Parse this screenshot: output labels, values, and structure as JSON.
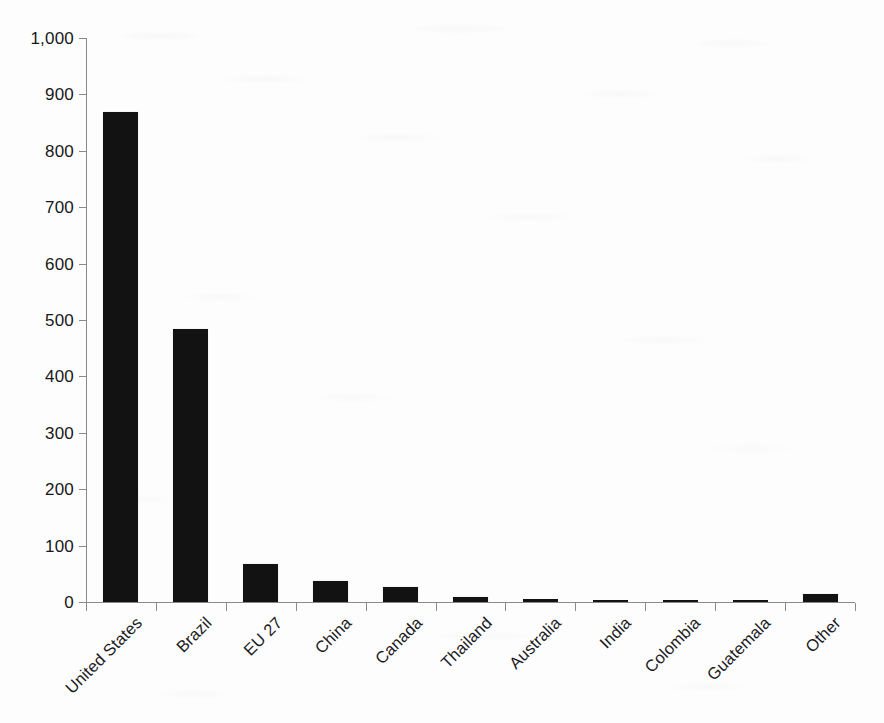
{
  "chart_data": {
    "type": "bar",
    "title": "",
    "subtitle": "",
    "xlabel": "",
    "ylabel": "",
    "categories": [
      "United States",
      "Brazil",
      "EU 27",
      "China",
      "Canada",
      "Thailand",
      "Australia",
      "India",
      "Colombia",
      "Guatemala",
      "Other"
    ],
    "values": [
      868,
      484,
      67,
      38,
      26,
      9,
      6,
      4,
      4,
      2,
      14
    ],
    "ylim": [
      0,
      1000
    ],
    "ytick_values": [
      0,
      100,
      200,
      300,
      400,
      500,
      600,
      700,
      800,
      900,
      1000
    ],
    "ytick_labels": [
      "0",
      "100",
      "200",
      "300",
      "400",
      "500",
      "600",
      "700",
      "800",
      "900",
      "1,000"
    ],
    "grid": false,
    "legend": false,
    "legend_position": "none",
    "bar_color": "#121212",
    "axis_color": "#8a8a8a",
    "background_color": "#fdfdfd",
    "xtick_label_rotation": -45
  }
}
